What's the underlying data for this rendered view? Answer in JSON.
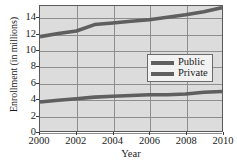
{
  "chart_data": {
    "type": "line",
    "title": "",
    "xlabel": "Year",
    "ylabel": "Enrollment (in millions)",
    "xlim": [
      2000,
      2010
    ],
    "ylim": [
      0,
      15.5
    ],
    "xticks": [
      2000,
      2002,
      2004,
      2006,
      2008,
      2010
    ],
    "yticks": [
      0,
      2,
      4,
      6,
      8,
      10,
      12,
      14
    ],
    "grid": true,
    "legend_position": "center-right",
    "x": [
      2000,
      2001,
      2002,
      2003,
      2004,
      2005,
      2006,
      2007,
      2008,
      2009,
      2010
    ],
    "series": [
      {
        "name": "Public",
        "color": "#5f5f5f",
        "values": [
          11.7,
          12.1,
          12.4,
          13.2,
          13.4,
          13.6,
          13.8,
          14.1,
          14.4,
          14.8,
          15.3
        ]
      },
      {
        "name": "Private",
        "color": "#5f5f5f",
        "values": [
          3.6,
          3.8,
          4.0,
          4.2,
          4.3,
          4.4,
          4.5,
          4.5,
          4.6,
          4.8,
          4.9
        ]
      }
    ]
  },
  "axes": {
    "y_title": "Enrollment (in millions)",
    "x_title": "Year",
    "y_tick_labels": [
      "14",
      "12",
      "10",
      "8",
      "6",
      "4",
      "2",
      "0"
    ],
    "x_tick_labels": [
      "2000",
      "2002",
      "2004",
      "2006",
      "2008",
      "2010"
    ]
  },
  "legend": {
    "entries": [
      {
        "label": "Public"
      },
      {
        "label": "Private"
      }
    ]
  },
  "colors": {
    "plot_background": "#dcdcdc",
    "gridline": "#8e8e8e",
    "frame": "#5a5a5a",
    "series_line": "#5f5f5f",
    "text": "#1a1a1a",
    "legend_background": "#f2f2f2"
  }
}
